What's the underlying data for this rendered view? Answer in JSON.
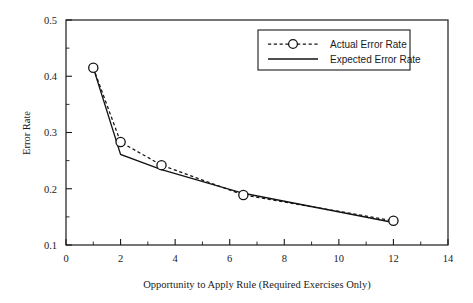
{
  "chart_data": {
    "type": "line",
    "title": "",
    "xlabel": "Opportunity to Apply Rule (Required Exercises Only)",
    "ylabel": "Error Rate",
    "xlim": [
      0,
      14
    ],
    "ylim": [
      0.1,
      0.5
    ],
    "grid": false,
    "legend_position": "top-right",
    "x_ticks": [
      "0",
      "2",
      "4",
      "6",
      "8",
      "10",
      "12",
      "14"
    ],
    "x_tick_values": [
      0,
      2,
      4,
      6,
      8,
      10,
      12,
      14
    ],
    "x_minor_tick_values": [
      1,
      3,
      5,
      7,
      9,
      11,
      13
    ],
    "y_ticks": [
      "0.1",
      "0.2",
      "0.3",
      "0.4",
      "0.5"
    ],
    "y_tick_values": [
      0.1,
      0.2,
      0.3,
      0.4,
      0.5
    ],
    "y_minor_tick_values": [
      0.15,
      0.25,
      0.35,
      0.45
    ],
    "x": [
      1,
      2,
      3.5,
      6.5,
      12
    ],
    "series": [
      {
        "name": "Actual Error Rate",
        "style": "dashed",
        "marker": "open-circle",
        "values": [
          0.415,
          0.283,
          0.242,
          0.189,
          0.143
        ]
      },
      {
        "name": "Expected Error Rate",
        "style": "solid",
        "marker": "none",
        "values": [
          0.415,
          0.261,
          0.234,
          0.192,
          0.14
        ]
      }
    ]
  },
  "legend": {
    "entries": [
      {
        "label": "Actual Error Rate"
      },
      {
        "label": "Expected Error Rate"
      }
    ]
  }
}
